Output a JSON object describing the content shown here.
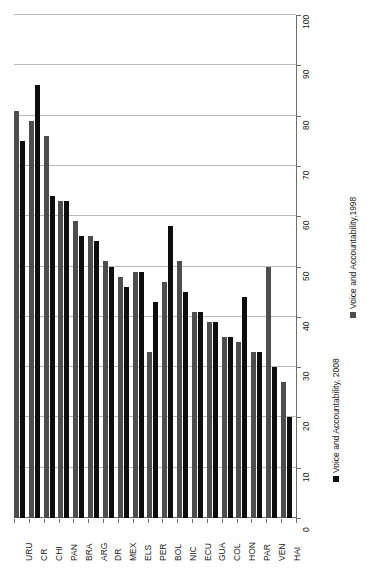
{
  "chart_data": {
    "type": "bar",
    "title": "",
    "subtitle": "",
    "xlabel": "",
    "ylabel": "",
    "orientation": "vertical-rotated",
    "grid": true,
    "legend_position": "right",
    "ylim": [
      0,
      100
    ],
    "ytick_step": 10,
    "yticks": [
      0,
      10,
      20,
      30,
      40,
      50,
      60,
      70,
      80,
      90,
      100
    ],
    "ytick_labels": [
      "0",
      "10",
      "20",
      "30",
      "40",
      "50",
      "60",
      "70",
      "80",
      "90",
      "100"
    ],
    "categories": [
      "URU",
      "CR",
      "CHI",
      "PAN",
      "BRA",
      "ARG",
      "DR",
      "MEX",
      "ELS",
      "PER",
      "BOL",
      "NIC",
      "ECU",
      "GUA",
      "COL",
      "HON",
      "PAR",
      "VEN",
      "HAI"
    ],
    "series": [
      {
        "name": "Voice and Accountability,1998",
        "color": "#4d4d4d",
        "values": [
          81,
          79,
          76,
          63,
          59,
          56,
          51,
          48,
          49,
          33,
          47,
          51,
          41,
          39,
          36,
          35,
          33,
          50,
          27
        ]
      },
      {
        "name": "Voice and Accountability, 2008",
        "color": "#0d0d0d",
        "values": [
          75,
          86,
          64,
          63,
          56,
          55,
          50,
          46,
          49,
          43,
          58,
          45,
          41,
          39,
          36,
          44,
          33,
          30,
          20
        ]
      }
    ]
  },
  "axes": {
    "value_axis": {
      "name": "value-axis",
      "min": 0,
      "max": 100,
      "step": 10,
      "labels": [
        "0",
        "10",
        "20",
        "30",
        "40",
        "50",
        "60",
        "70",
        "80",
        "90",
        "100"
      ]
    },
    "category_axis": {
      "name": "category-axis",
      "labels": [
        "URU",
        "CR",
        "CHI",
        "PAN",
        "BRA",
        "ARG",
        "DR",
        "MEX",
        "ELS",
        "PER",
        "BOL",
        "NIC",
        "ECU",
        "GUA",
        "COL",
        "HON",
        "PAR",
        "VEN",
        "HAI"
      ]
    }
  },
  "legend": {
    "entries": [
      {
        "label": "Voice and Accountability,1998",
        "color": "#4d4d4d"
      },
      {
        "label": "Voice and Accountability, 2008",
        "color": "#0d0d0d"
      }
    ]
  },
  "colors": {
    "series_1998": "#4d4d4d",
    "series_2008": "#0d0d0d",
    "gridline": "#b9b9b9",
    "axis": "#6d6d6d",
    "background": "#ffffff",
    "text": "#1a1a1a"
  }
}
